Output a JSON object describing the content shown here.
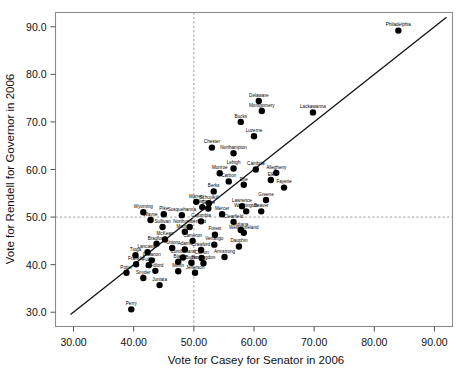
{
  "chart_data": {
    "type": "scatter",
    "title": "",
    "xlabel": "Vote for Casey for Senator in 2006",
    "ylabel": "Vote for Rendell for Governor in 2006",
    "xlim": [
      27.0,
      93.0
    ],
    "ylim": [
      27.0,
      93.0
    ],
    "xticks": [
      30.0,
      40.0,
      50.0,
      60.0,
      70.0,
      80.0,
      90.0
    ],
    "xtick_labels": [
      "30.00",
      "40.00",
      "50.00",
      "60.00",
      "70.00",
      "80.00",
      "90.00"
    ],
    "yticks": [
      30.0,
      40.0,
      50.0,
      60.0,
      70.0,
      80.0,
      90.0
    ],
    "ytick_labels": [
      "30.0",
      "40.0",
      "50.0",
      "60.0",
      "70.0",
      "80.0",
      "90.0"
    ],
    "grid": false,
    "legend": "none",
    "reference_lines": [
      {
        "name": "identity-line",
        "kind": "diagonal",
        "style": "solid",
        "from": [
          29.5,
          29.5
        ],
        "to": [
          92.0,
          92.0
        ]
      },
      {
        "name": "vertical-50-line",
        "kind": "vertical",
        "style": "dashed",
        "value": 50.0
      },
      {
        "name": "horizontal-50-line",
        "kind": "horizontal",
        "style": "dashed",
        "value": 50.0
      }
    ],
    "marker": {
      "shape": "circle",
      "color": "#000000",
      "size": 3.2
    },
    "points": [
      {
        "label": "Philadelphia",
        "x": 84.0,
        "y": 89.2
      },
      {
        "label": "Lackawanna",
        "x": 69.8,
        "y": 72.0
      },
      {
        "label": "Delaware",
        "x": 60.8,
        "y": 74.4
      },
      {
        "label": "Montgomery",
        "x": 61.3,
        "y": 72.3
      },
      {
        "label": "Bucks",
        "x": 57.8,
        "y": 70.0
      },
      {
        "label": "Luzerne",
        "x": 60.0,
        "y": 67.0
      },
      {
        "label": "Chester",
        "x": 53.0,
        "y": 64.6
      },
      {
        "label": "Northampton",
        "x": 56.6,
        "y": 63.4
      },
      {
        "label": "Lehigh",
        "x": 56.6,
        "y": 60.2
      },
      {
        "label": "Cambria",
        "x": 60.3,
        "y": 60.0
      },
      {
        "label": "Allegheny",
        "x": 63.7,
        "y": 59.3
      },
      {
        "label": "Monroe",
        "x": 54.3,
        "y": 59.2
      },
      {
        "label": "Carbon",
        "x": 55.8,
        "y": 57.5
      },
      {
        "label": "Elk",
        "x": 62.8,
        "y": 57.8
      },
      {
        "label": "Erie",
        "x": 58.3,
        "y": 56.8
      },
      {
        "label": "Fayette",
        "x": 65.0,
        "y": 56.2
      },
      {
        "label": "Berks",
        "x": 53.3,
        "y": 55.4
      },
      {
        "label": "Greene",
        "x": 62.0,
        "y": 53.6
      },
      {
        "label": "Warren",
        "x": 50.4,
        "y": 53.2
      },
      {
        "label": "Schuylkill",
        "x": 52.5,
        "y": 52.9
      },
      {
        "label": "Lawrence",
        "x": 58.0,
        "y": 52.3
      },
      {
        "label": "Clinton",
        "x": 51.4,
        "y": 52.1
      },
      {
        "label": "Centre",
        "x": 52.4,
        "y": 51.8
      },
      {
        "label": "Washington",
        "x": 58.7,
        "y": 51.2
      },
      {
        "label": "Beaver",
        "x": 61.2,
        "y": 51.2
      },
      {
        "label": "Mercer",
        "x": 54.7,
        "y": 50.6
      },
      {
        "label": "Susquehanna",
        "x": 48.0,
        "y": 50.4
      },
      {
        "label": "Pike",
        "x": 45.0,
        "y": 50.6
      },
      {
        "label": "Wyoming",
        "x": 41.6,
        "y": 51.0
      },
      {
        "label": "Wayne",
        "x": 42.8,
        "y": 49.4
      },
      {
        "label": "Columbia",
        "x": 51.2,
        "y": 49.1
      },
      {
        "label": "Clearfield",
        "x": 56.6,
        "y": 49.0
      },
      {
        "label": "Sullivan",
        "x": 44.8,
        "y": 47.9
      },
      {
        "label": "Northumberland",
        "x": 49.3,
        "y": 47.9
      },
      {
        "label": "Indiana",
        "x": 57.8,
        "y": 47.3
      },
      {
        "label": "Montour",
        "x": 48.5,
        "y": 46.9
      },
      {
        "label": "Westmoreland",
        "x": 58.3,
        "y": 46.7
      },
      {
        "label": "Forest",
        "x": 53.5,
        "y": 46.3
      },
      {
        "label": "Tioga",
        "x": 40.3,
        "y": 42.0
      },
      {
        "label": "McKean",
        "x": 45.2,
        "y": 45.3
      },
      {
        "label": "Cameron",
        "x": 49.8,
        "y": 45.0
      },
      {
        "label": "Bradford",
        "x": 43.8,
        "y": 44.4
      },
      {
        "label": "Venango",
        "x": 53.4,
        "y": 44.2
      },
      {
        "label": "Dauphin",
        "x": 57.5,
        "y": 43.8
      },
      {
        "label": "Union",
        "x": 46.4,
        "y": 43.5
      },
      {
        "label": "Adams",
        "x": 48.5,
        "y": 43.2
      },
      {
        "label": "Crawford",
        "x": 51.2,
        "y": 43.1
      },
      {
        "label": "Lancaster",
        "x": 42.3,
        "y": 42.6
      },
      {
        "label": "Cumberland",
        "x": 48.2,
        "y": 41.5
      },
      {
        "label": "Clarion",
        "x": 51.3,
        "y": 41.4
      },
      {
        "label": "Armstrong",
        "x": 55.1,
        "y": 41.6
      },
      {
        "label": "Lebanon",
        "x": 43.0,
        "y": 40.9
      },
      {
        "label": "Blair",
        "x": 47.4,
        "y": 40.6
      },
      {
        "label": "Butler",
        "x": 49.6,
        "y": 40.4
      },
      {
        "label": "Huntingdon",
        "x": 51.6,
        "y": 40.3
      },
      {
        "label": "Franklin",
        "x": 40.4,
        "y": 40.1
      },
      {
        "label": "Fulton",
        "x": 42.5,
        "y": 39.9
      },
      {
        "label": "Bedford",
        "x": 43.6,
        "y": 38.7
      },
      {
        "label": "Mifflin",
        "x": 47.4,
        "y": 38.6
      },
      {
        "label": "Jefferson",
        "x": 50.2,
        "y": 38.3
      },
      {
        "label": "Potter",
        "x": 38.8,
        "y": 38.3
      },
      {
        "label": "Snyder",
        "x": 41.6,
        "y": 37.2
      },
      {
        "label": "Juniata",
        "x": 44.3,
        "y": 35.7
      },
      {
        "label": "Perry",
        "x": 39.6,
        "y": 30.6
      }
    ]
  },
  "labels": {
    "xlabel": "Vote for Casey for Senator in 2006",
    "ylabel": "Vote for Rendell for Governor in 2006"
  }
}
